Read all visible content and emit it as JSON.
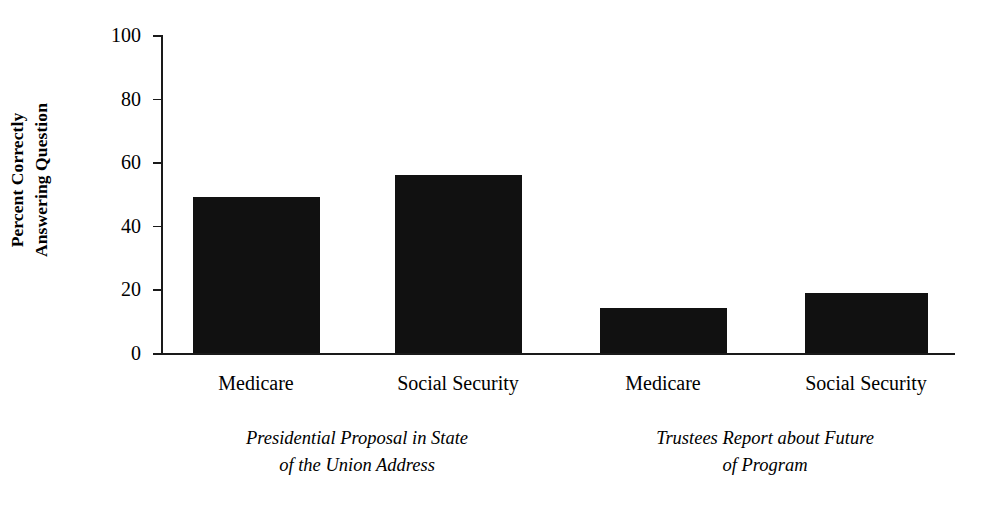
{
  "chart_data": {
    "type": "bar",
    "title": "",
    "xlabel": "",
    "ylabel_line1": "Percent Correctly",
    "ylabel_line2": "Answering Question",
    "ylabel": "Percent Correctly Answering Question",
    "ylim": [
      0,
      100
    ],
    "ytick_labels": [
      "100",
      "80",
      "60",
      "40",
      "20",
      "0"
    ],
    "yticks": [
      100,
      80,
      60,
      40,
      20,
      0
    ],
    "grid": false,
    "legend": "none",
    "bar_color": "#111111",
    "categories": [
      "Medicare",
      "Social Security",
      "Medicare",
      "Social Security"
    ],
    "values": [
      49,
      56,
      14,
      19
    ],
    "groups": [
      {
        "caption_line1": "Presidential Proposal in State",
        "caption_line2": "of the Union Address",
        "categories": [
          "Medicare",
          "Social Security"
        ],
        "values": [
          49,
          56
        ]
      },
      {
        "caption_line1": "Trustees Report about Future",
        "caption_line2": "of Program",
        "categories": [
          "Medicare",
          "Social Security"
        ],
        "values": [
          14,
          19
        ]
      }
    ]
  },
  "axis": {
    "ticks": [
      {
        "label": "100",
        "value": 100
      },
      {
        "label": "80",
        "value": 80
      },
      {
        "label": "60",
        "value": 60
      },
      {
        "label": "40",
        "value": 40
      },
      {
        "label": "20",
        "value": 20
      },
      {
        "label": "0",
        "value": 0
      }
    ]
  },
  "bars": [
    {
      "label": "Medicare",
      "value": 49,
      "center_pct": 20.2,
      "width_pct": 16.0
    },
    {
      "label": "Social Security",
      "value": 56,
      "center_pct": 45.6,
      "width_pct": 16.0
    },
    {
      "label": "Medicare",
      "value": 14,
      "center_pct": 71.4,
      "width_pct": 16.0
    },
    {
      "label": "Social Security",
      "value": 19,
      "center_pct": 96.6,
      "width_pct": 15.5
    }
  ]
}
